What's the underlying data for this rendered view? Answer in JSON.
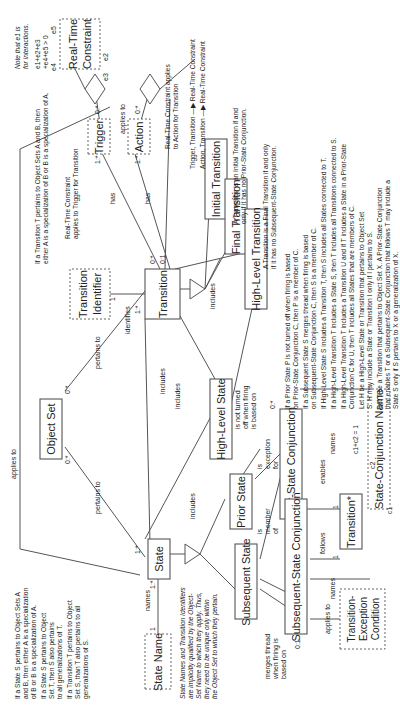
{
  "objects": {
    "state": "State",
    "state_name": "State Name",
    "object_set": "Object Set",
    "transition": "Transition",
    "transition_identifier": [
      "Transition",
      "Identifier"
    ],
    "trigger": "Trigger",
    "action": "Action",
    "real_time_constraint": [
      "Real-Time",
      "Constraint"
    ],
    "initial_transition": "Initial Transition",
    "final_transition": "Final Transition",
    "high_level_transition": "High-Level Transition",
    "high_level_state": "High-Level State",
    "prior_state": "Prior State",
    "subsequent_state": "Subsequent State",
    "prior_state_conjunction": "Prior-State Conjunction",
    "subsequent_state_conjunction": "Subsequent-State Conjunction",
    "transition_star": "Transition*",
    "state_conjunction_name": "State-Conjunction Name",
    "transition_exception_condition": [
      "Transition-",
      "Exception",
      "Condition"
    ]
  },
  "relationships": {
    "names": "names",
    "pertains_to": "pertains to",
    "applies_to": "applies to",
    "identifies": "identifies",
    "has": "has",
    "includes": "includes",
    "enables": "enables",
    "follows": "follows",
    "is_exception_for": [
      "is",
      "exception",
      "for"
    ],
    "is_member_of": [
      "is",
      "member",
      "of"
    ],
    "merges_thread": [
      "merges thread",
      "when firing is",
      "based on"
    ],
    "not_turned_off": [
      "is not turned",
      "off when firing",
      "is based on"
    ]
  },
  "participation": {
    "zero_many": "0:*",
    "one_many": "1:*",
    "zero_one": "0:1",
    "one": "1",
    "e1": "e1",
    "e2": "e2",
    "e3": "e3",
    "e4": "e4",
    "e5": "e5",
    "c1": "c1",
    "c2": "c2"
  },
  "constraints": {
    "interactions_note": [
      "Note that e1 is",
      "for Interactions."
    ],
    "e_sum": [
      "e1+e2+e3",
      "+e4+e5 > 0"
    ],
    "c_sum": "c1+c2 = 1",
    "rtc_action": [
      "Real-Time Constraint applies",
      "to Action for Transition"
    ],
    "rtc_trigger": [
      "Real-Time Constraint",
      "applies to Trigger for Transition"
    ],
    "arrow_legend": [
      "Trigger, Transition —▶ Real-Time Constraint",
      "Action, Transition —▶ Real-Time Constraint"
    ],
    "initial_def": [
      "A Transition is an Initial Transition if and",
      "only if it has no Prior-State Conjunction."
    ],
    "final_def": [
      "A Transition is a Final Transition if and only",
      "if it has no Subsequent-State Conjunction."
    ],
    "transition_pertains": [
      "If a Transition T pertains to Object Sets A and B, then",
      "either A is a specialization of B or B is a specialization of A."
    ],
    "rules": [
      "If a Prior State P is not turned off when firing is based",
      "on Prior-State Conjunction C, then P is a member of C.",
      "If a Subsequent State S merges thread when firing is based",
      "on Subsequent-State Conjunction C, then S is a member of C.",
      "If High-Level State S includes a Transition T, then S includes all States connected to T.",
      "If a High-Level Transition T includes a State S, then T includes all Transitions connected to S.",
      "If a High-Level Transition T includes a Transition U and if T includes a State in a Prior-State",
      "Conjunction C for U, then T includes all States that are members of C.",
      "Let H be a High-Level State or Transition that pertains to Object Set",
      "S.  H may include a State or Transition I only if I pertains to S.",
      "Let T be a Transition that pertains to Object Set X.  A Prior-State Conjunction",
      "that enables T or a Subsequent-State Conjunction that follows T may include a",
      "State S only if S pertains to X or a generalization of X."
    ],
    "state_rules": [
      "If a State S pertains to Object Sets A",
      "and B, then either A is a specialization",
      "of B or B is a specialization of A.",
      "If a State S pertains to Object",
      "Set T, then S also pertains",
      "to all generalizations of T.",
      "If a Transition T pertains to Object",
      "Set S, than T also pertains to all",
      "generalizations of S."
    ],
    "names_note": [
      "State Names and Transition Identifiers",
      "are implicitly qualified by the Object-",
      "Set Name to which they apply.  Thus,",
      "they need to be unique only within",
      "the Object Set to which they pertain."
    ]
  }
}
